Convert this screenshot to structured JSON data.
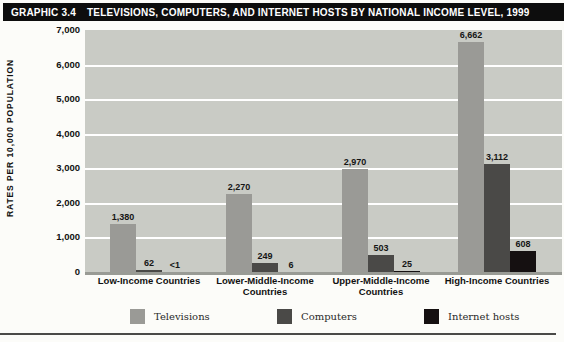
{
  "title_bar": {
    "graphic_number": "GRAPHIC 3.4",
    "title": "TELEVISIONS, COMPUTERS, AND INTERNET HOSTS BY NATIONAL INCOME LEVEL, 1999"
  },
  "colors": {
    "title_bar_bg": "#0d0d0d",
    "title_bar_fg": "#ffffff",
    "plot_bg": "#c9cbc5",
    "gridline": "#ffffff",
    "axis_baseline": "#999b95",
    "televisions": "#9a9a96",
    "computers": "#4a4947",
    "internet_hosts": "#151011"
  },
  "chart_data": {
    "type": "bar",
    "title": "GRAPHIC 3.4  TELEVISIONS, COMPUTERS, AND INTERNET HOSTS BY NATIONAL INCOME LEVEL, 1999",
    "xlabel": "",
    "ylabel": "RATES PER 10,000 POPULATION",
    "ylim": [
      0,
      7000
    ],
    "ytick_interval": 1000,
    "ytick_labels": [
      "7,000",
      "6,000",
      "5,000",
      "4,000",
      "3,000",
      "2,000",
      "1,000",
      "0"
    ],
    "grid": true,
    "legend_position": "bottom",
    "categories": [
      "Low-Income Countries",
      "Lower-Middle-Income Countries",
      "Upper-Middle-Income Countries",
      "High-Income Countries"
    ],
    "series": [
      {
        "name": "Televisions",
        "color": "#9a9a96",
        "values": [
          1380,
          2270,
          2970,
          6662
        ],
        "labels": [
          "1,380",
          "2,270",
          "2,970",
          "6,662"
        ]
      },
      {
        "name": "Computers",
        "color": "#4a4947",
        "values": [
          62,
          249,
          503,
          3112
        ],
        "labels": [
          "62",
          "249",
          "503",
          "3,112"
        ]
      },
      {
        "name": "Internet hosts",
        "color": "#151011",
        "values": [
          0.5,
          6,
          25,
          608
        ],
        "labels": [
          "<1",
          "6",
          "25",
          "608"
        ]
      }
    ]
  }
}
